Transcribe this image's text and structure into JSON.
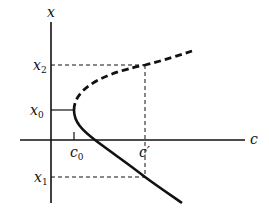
{
  "diagram": {
    "type": "bifurcation-diagram",
    "axes": {
      "vertical_label": "x",
      "horizontal_label": "c"
    },
    "labels": {
      "x2": {
        "base": "x",
        "sub": "2"
      },
      "x0": {
        "base": "x",
        "sub": "0"
      },
      "x1": {
        "base": "x",
        "sub": "1"
      },
      "c0": {
        "base": "c",
        "sub": "0"
      },
      "cprime": "c′"
    },
    "curves": [
      {
        "name": "upper-branch",
        "style": "dashed",
        "meaning": "unstable"
      },
      {
        "name": "lower-branch",
        "style": "solid",
        "meaning": "stable"
      }
    ],
    "colors": {
      "ink": "#111111",
      "background": "#ffffff"
    }
  }
}
